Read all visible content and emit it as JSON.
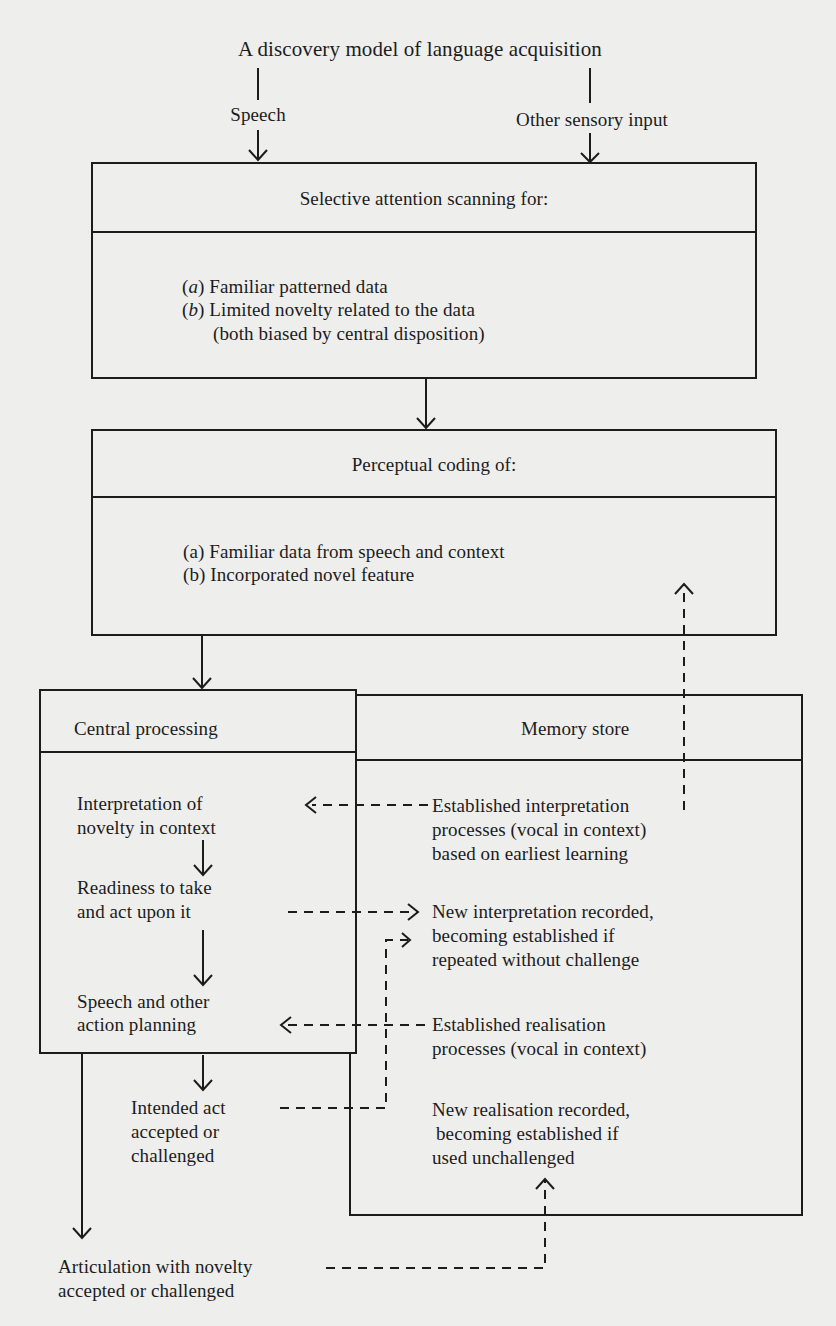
{
  "title": "A discovery model of language acquisition",
  "inputs": {
    "speech": "Speech",
    "other": "Other sensory input"
  },
  "box_attention": {
    "header": "Selective attention scanning for:",
    "items": [
      {
        "marker": "a",
        "text": "Familiar patterned data"
      },
      {
        "marker": "b",
        "text": "Limited novelty related to the data"
      }
    ],
    "note": "(both biased by central disposition)"
  },
  "box_perceptual": {
    "header": "Perceptual coding of:",
    "items": [
      "(a) Familiar data from speech and context",
      "(b) Incorporated novel feature"
    ]
  },
  "central_processing": {
    "header": "Central processing",
    "steps": [
      [
        "Interpretation of",
        "novelty in context"
      ],
      [
        "Readiness to take",
        "and act upon it"
      ],
      [
        "Speech and other",
        "action planning"
      ]
    ],
    "outside": [
      [
        "Intended act",
        "accepted or",
        "challenged"
      ]
    ]
  },
  "memory_store": {
    "header": "Memory store",
    "entries": [
      [
        "Established interpretation",
        "processes (vocal in context)",
        "based on earliest learning"
      ],
      [
        "New interpretation recorded,",
        "becoming established if",
        "repeated without challenge"
      ],
      [
        "Established realisation",
        "processes (vocal in context)"
      ],
      [
        "New realisation recorded,",
        "becoming established if",
        "used unchallenged"
      ]
    ]
  },
  "output": [
    "Articulation with novelty",
    "accepted or challenged"
  ],
  "colors": {
    "paper": "#eeeeec",
    "ink": "#1c1c1c"
  }
}
